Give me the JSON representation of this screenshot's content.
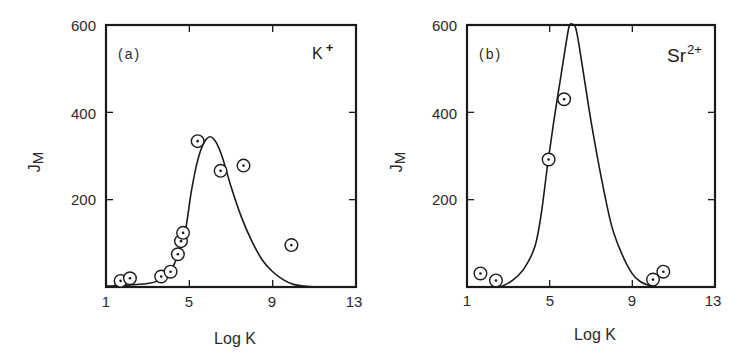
{
  "chart_data": [
    {
      "type": "scatter",
      "panel": "(a)",
      "annotation": "K+",
      "ion": "K",
      "ion_charge": "+",
      "xlabel": "Log K",
      "ylabel": "J_M",
      "xlim": [
        1,
        13
      ],
      "ylim": [
        0,
        600
      ],
      "xticks": [
        1,
        5,
        9,
        13
      ],
      "yticks": [
        200,
        400,
        600
      ],
      "grid": false,
      "legend": null,
      "series": [
        {
          "name": "experimental",
          "marker": "circled-dot",
          "x": [
            1.7,
            2.15,
            3.65,
            4.1,
            4.45,
            4.6,
            4.7,
            5.4,
            6.5,
            7.6,
            9.9
          ],
          "y": [
            14,
            20,
            24,
            35,
            75,
            105,
            124,
            334,
            266,
            278,
            96
          ]
        },
        {
          "name": "fitted curve",
          "style": "line",
          "x": [
            1.0,
            2.0,
            3.0,
            3.5,
            4.0,
            4.3,
            4.6,
            4.85,
            5.1,
            5.4,
            5.7,
            6.0,
            6.3,
            6.6,
            7.0,
            7.5,
            8.0,
            8.5,
            9.0,
            9.5,
            10.0,
            10.5,
            11.0
          ],
          "y": [
            2,
            4,
            8,
            14,
            30,
            55,
            95,
            140,
            220,
            290,
            330,
            344,
            330,
            295,
            230,
            160,
            105,
            62,
            35,
            17,
            6,
            2,
            0
          ]
        }
      ]
    },
    {
      "type": "scatter",
      "panel": "(b)",
      "annotation": "Sr2+",
      "ion": "Sr",
      "ion_charge": "2+",
      "xlabel": "Log K",
      "ylabel": "J_M",
      "xlim": [
        1,
        13
      ],
      "ylim": [
        0,
        600
      ],
      "xticks": [
        1,
        5,
        9,
        13
      ],
      "yticks": [
        200,
        400,
        600
      ],
      "grid": false,
      "legend": null,
      "series": [
        {
          "name": "experimental",
          "marker": "circled-dot",
          "x": [
            1.65,
            2.4,
            4.95,
            5.7,
            10.0,
            10.5
          ],
          "y": [
            31,
            15,
            292,
            430,
            17,
            35
          ]
        },
        {
          "name": "fitted curve",
          "style": "line",
          "x": [
            2.6,
            3.2,
            3.8,
            4.3,
            4.6,
            4.9,
            5.2,
            5.5,
            5.8,
            5.95,
            6.1,
            6.25,
            6.4,
            6.7,
            7.0,
            7.5,
            8.0,
            8.5,
            9.0,
            9.4,
            9.8,
            10.2
          ],
          "y": [
            0,
            15,
            45,
            95,
            170,
            280,
            380,
            470,
            560,
            598,
            602,
            595,
            560,
            470,
            380,
            250,
            140,
            75,
            30,
            12,
            4,
            0
          ]
        }
      ]
    }
  ],
  "panels": [
    {
      "label": "(a)",
      "ion_base": "K",
      "ion_sup": "+",
      "xlabel": "Log K",
      "ylabel_main": "J",
      "ylabel_sub": "M",
      "xtick_labels": [
        "1",
        "5",
        "9",
        "13"
      ],
      "ytick_labels": [
        "600",
        "400",
        "200"
      ]
    },
    {
      "label": "(b)",
      "ion_base": "Sr",
      "ion_sup": "2+",
      "xlabel": "Log K",
      "ylabel_main": "J",
      "ylabel_sub": "M",
      "xtick_labels": [
        "1",
        "5",
        "9",
        "13"
      ],
      "ytick_labels": [
        "600",
        "400",
        "200"
      ]
    }
  ]
}
